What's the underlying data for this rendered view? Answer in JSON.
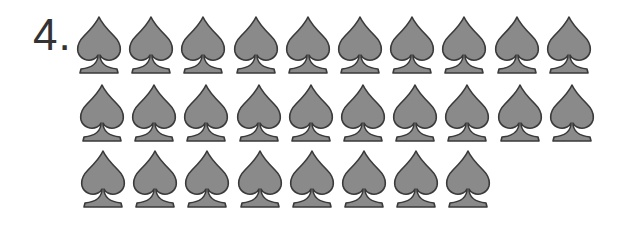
{
  "problem": {
    "number_label": "4.",
    "icon": "spade-icon",
    "fill_color": "#8a8a8a",
    "stroke_color": "#3a3a3a",
    "rows": [
      {
        "count": 10
      },
      {
        "count": 10
      },
      {
        "count": 8
      }
    ],
    "total": 28
  }
}
